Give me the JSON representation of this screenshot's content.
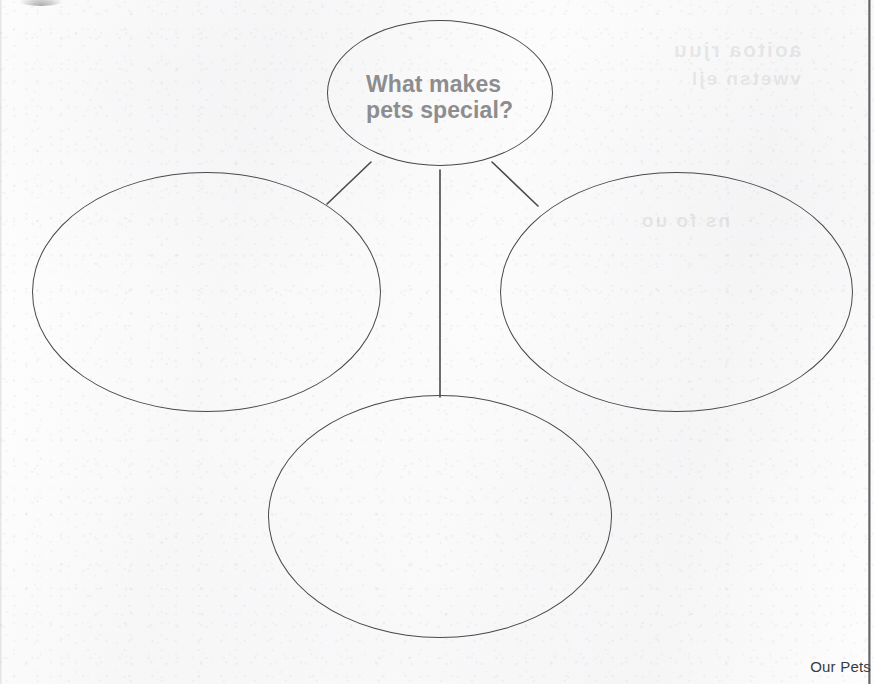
{
  "document": {
    "kind": "scanned-worksheet",
    "title_text": "What makes pets special?",
    "footer_label": "Our Pets"
  },
  "colors": {
    "paper": "#fafafa",
    "ink_outline": "#4a4a4e",
    "prompt_text": "#8d8d8f",
    "footer_text": "#3b3b3d",
    "scan_edge": "#3c3e42"
  },
  "prompt": {
    "line_1": "What makes",
    "line_2": "pets special?"
  },
  "organizer": {
    "type": "bubble-web",
    "center_bubble": {
      "name": "center-bubble",
      "text_line_1": "What makes",
      "text_line_2": "pets special?"
    },
    "answer_bubbles": [
      {
        "name": "answer-bubble-left",
        "value": ""
      },
      {
        "name": "answer-bubble-right",
        "value": ""
      },
      {
        "name": "answer-bubble-bottom",
        "value": ""
      }
    ],
    "connector_count": "3"
  },
  "ghost_bleed": {
    "line_1": "aoitoa rjuu",
    "line_2": "vwetsn ejl",
    "line_3": "ns fo uo"
  },
  "footer": {
    "label": "Our Pets"
  }
}
